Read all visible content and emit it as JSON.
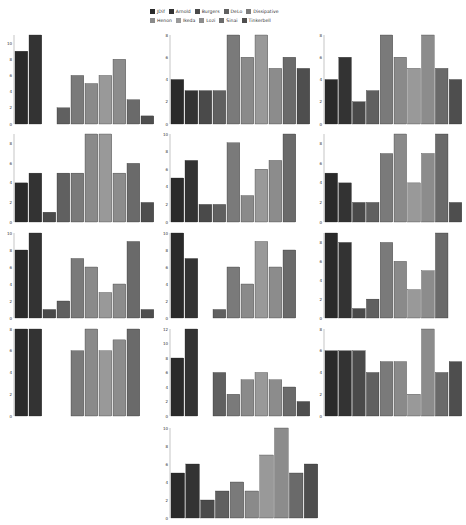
{
  "legend": {
    "items": [
      {
        "label": "JDif",
        "color": "#2a2a2a"
      },
      {
        "label": "Arnold",
        "color": "#333333"
      },
      {
        "label": "Burgers",
        "color": "#4a4a4a"
      },
      {
        "label": "DeLo",
        "color": "#606060"
      },
      {
        "label": "Dissipative",
        "color": "#7a7a7a"
      },
      {
        "label": "Henon",
        "color": "#8a8a8a"
      },
      {
        "label": "Ikeda",
        "color": "#999999"
      },
      {
        "label": "Lozi",
        "color": "#8c8c8c"
      },
      {
        "label": "Sinai",
        "color": "#6a6a6a"
      },
      {
        "label": "Tinkerbell",
        "color": "#4e4e4e"
      }
    ]
  },
  "chart_data": [
    {
      "type": "bar",
      "panel": 1,
      "categories": [
        "JDif",
        "Arnold",
        "Burgers",
        "DeLo",
        "Dissipative",
        "Henon",
        "Ikeda",
        "Lozi",
        "Sinai",
        "Tinkerbell"
      ],
      "values": [
        9,
        11,
        0,
        2,
        6,
        5,
        6,
        8,
        3,
        1
      ],
      "yticks": [
        0,
        2,
        4,
        6,
        8,
        10
      ],
      "ylim": [
        0,
        11
      ]
    },
    {
      "type": "bar",
      "panel": 2,
      "categories": [
        "JDif",
        "Arnold",
        "Burgers",
        "DeLo",
        "Dissipative",
        "Henon",
        "Ikeda",
        "Lozi",
        "Sinai",
        "Tinkerbell"
      ],
      "values": [
        4,
        3,
        3,
        3,
        8,
        6,
        8,
        5,
        6,
        5
      ],
      "yticks": [
        0,
        2,
        4,
        6,
        8
      ],
      "ylim": [
        0,
        8
      ]
    },
    {
      "type": "bar",
      "panel": 3,
      "categories": [
        "JDif",
        "Arnold",
        "Burgers",
        "DeLo",
        "Dissipative",
        "Henon",
        "Ikeda",
        "Lozi",
        "Sinai",
        "Tinkerbell"
      ],
      "values": [
        4,
        6,
        2,
        3,
        8,
        6,
        5,
        8,
        5,
        4
      ],
      "yticks": [
        0,
        2,
        4,
        6,
        8
      ],
      "ylim": [
        0,
        8
      ]
    },
    {
      "type": "bar",
      "panel": 4,
      "categories": [
        "JDif",
        "Arnold",
        "Burgers",
        "DeLo",
        "Dissipative",
        "Henon",
        "Ikeda",
        "Lozi",
        "Sinai",
        "Tinkerbell"
      ],
      "values": [
        4,
        5,
        1,
        5,
        5,
        9,
        9,
        5,
        6,
        2
      ],
      "yticks": [
        0,
        2,
        4,
        6,
        8
      ],
      "ylim": [
        0,
        9
      ]
    },
    {
      "type": "bar",
      "panel": 5,
      "categories": [
        "JDif",
        "Arnold",
        "Burgers",
        "DeLo",
        "Dissipative",
        "Henon",
        "Ikeda",
        "Lozi",
        "Sinai",
        "Tinkerbell"
      ],
      "values": [
        5,
        7,
        2,
        2,
        9,
        3,
        6,
        7,
        10,
        0
      ],
      "yticks": [
        0,
        2,
        4,
        6,
        8,
        10
      ],
      "ylim": [
        0,
        10
      ]
    },
    {
      "type": "bar",
      "panel": 6,
      "categories": [
        "JDif",
        "Arnold",
        "Burgers",
        "DeLo",
        "Dissipative",
        "Henon",
        "Ikeda",
        "Lozi",
        "Sinai",
        "Tinkerbell"
      ],
      "values": [
        5,
        4,
        2,
        2,
        7,
        9,
        4,
        7,
        9,
        2
      ],
      "yticks": [
        0,
        2,
        4,
        6,
        8
      ],
      "ylim": [
        0,
        9
      ]
    },
    {
      "type": "bar",
      "panel": 7,
      "categories": [
        "JDif",
        "Arnold",
        "Burgers",
        "DeLo",
        "Dissipative",
        "Henon",
        "Ikeda",
        "Lozi",
        "Sinai",
        "Tinkerbell"
      ],
      "values": [
        8,
        10,
        1,
        2,
        7,
        6,
        3,
        4,
        9,
        1
      ],
      "yticks": [
        0,
        2,
        4,
        6,
        8,
        10
      ],
      "ylim": [
        0,
        10
      ]
    },
    {
      "type": "bar",
      "panel": 8,
      "categories": [
        "JDif",
        "Arnold",
        "Burgers",
        "DeLo",
        "Dissipative",
        "Henon",
        "Ikeda",
        "Lozi",
        "Sinai",
        "Tinkerbell"
      ],
      "values": [
        10,
        7,
        0,
        1,
        6,
        4,
        9,
        6,
        8,
        0
      ],
      "yticks": [
        0,
        2,
        4,
        6,
        8,
        10
      ],
      "ylim": [
        0,
        10
      ]
    },
    {
      "type": "bar",
      "panel": 9,
      "categories": [
        "JDif",
        "Arnold",
        "Burgers",
        "DeLo",
        "Dissipative",
        "Henon",
        "Ikeda",
        "Lozi",
        "Sinai",
        "Tinkerbell"
      ],
      "values": [
        9,
        8,
        1,
        2,
        8,
        6,
        3,
        5,
        9,
        0
      ],
      "yticks": [
        0,
        2,
        4,
        6,
        8
      ],
      "ylim": [
        0,
        9
      ]
    },
    {
      "type": "bar",
      "panel": 10,
      "categories": [
        "JDif",
        "Arnold",
        "Burgers",
        "DeLo",
        "Dissipative",
        "Henon",
        "Ikeda",
        "Lozi",
        "Sinai",
        "Tinkerbell"
      ],
      "values": [
        8,
        8,
        0,
        0,
        6,
        8,
        6,
        7,
        8,
        0
      ],
      "yticks": [
        0,
        2,
        4,
        6,
        8
      ],
      "ylim": [
        0,
        8
      ]
    },
    {
      "type": "bar",
      "panel": 11,
      "categories": [
        "JDif",
        "Arnold",
        "Burgers",
        "DeLo",
        "Dissipative",
        "Henon",
        "Ikeda",
        "Lozi",
        "Sinai",
        "Tinkerbell"
      ],
      "values": [
        8,
        12,
        0,
        6,
        3,
        5,
        6,
        5,
        4,
        2
      ],
      "yticks": [
        0,
        2,
        4,
        6,
        8,
        10,
        12
      ],
      "ylim": [
        0,
        12
      ]
    },
    {
      "type": "bar",
      "panel": 12,
      "categories": [
        "JDif",
        "Arnold",
        "Burgers",
        "DeLo",
        "Dissipative",
        "Henon",
        "Ikeda",
        "Lozi",
        "Sinai",
        "Tinkerbell"
      ],
      "values": [
        6,
        6,
        6,
        4,
        5,
        5,
        2,
        8,
        4,
        5
      ],
      "yticks": [
        0,
        2,
        4,
        6,
        8
      ],
      "ylim": [
        0,
        8
      ]
    },
    {
      "type": "bar",
      "panel": 13,
      "categories": [
        "JDif",
        "Arnold",
        "Burgers",
        "DeLo",
        "Dissipative",
        "Henon",
        "Ikeda",
        "Lozi",
        "Sinai",
        "Tinkerbell"
      ],
      "values": [
        5,
        6,
        2,
        3,
        4,
        3,
        7,
        10,
        5,
        6
      ],
      "yticks": [
        0,
        2,
        4,
        6,
        8,
        10
      ],
      "ylim": [
        0,
        10
      ]
    }
  ],
  "layout": {
    "panels": [
      {
        "x": 4,
        "y": 32,
        "w": 152,
        "h": 96
      },
      {
        "x": 160,
        "y": 32,
        "w": 152,
        "h": 96
      },
      {
        "x": 314,
        "y": 32,
        "w": 150,
        "h": 96
      },
      {
        "x": 4,
        "y": 131,
        "w": 152,
        "h": 95
      },
      {
        "x": 160,
        "y": 131,
        "w": 152,
        "h": 95
      },
      {
        "x": 314,
        "y": 131,
        "w": 150,
        "h": 95
      },
      {
        "x": 4,
        "y": 230,
        "w": 152,
        "h": 92
      },
      {
        "x": 160,
        "y": 230,
        "w": 152,
        "h": 92
      },
      {
        "x": 314,
        "y": 230,
        "w": 150,
        "h": 92
      },
      {
        "x": 4,
        "y": 326,
        "w": 152,
        "h": 94
      },
      {
        "x": 160,
        "y": 326,
        "w": 152,
        "h": 94
      },
      {
        "x": 314,
        "y": 326,
        "w": 150,
        "h": 94
      },
      {
        "x": 160,
        "y": 425,
        "w": 160,
        "h": 97
      }
    ]
  }
}
